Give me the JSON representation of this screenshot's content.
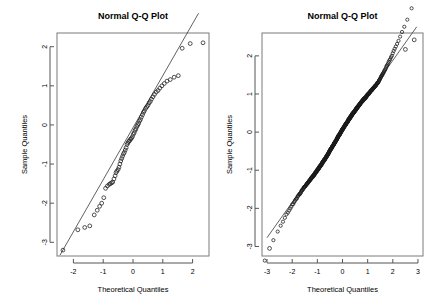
{
  "figure": {
    "background_color": "#ffffff",
    "foreground_color": "#000000",
    "panels": 2
  },
  "chart_data": [
    {
      "type": "scatter",
      "name": "left-qq-plot",
      "title": "Normal Q-Q Plot",
      "xlabel": "Theoretical Quantiles",
      "ylabel": "Sample Quantiles",
      "xlim": [
        -2.55,
        2.55
      ],
      "ylim": [
        -3.35,
        2.35
      ],
      "xticks": [
        -2,
        -1,
        0,
        1,
        2
      ],
      "xticklabels": [
        "-2",
        "-1",
        "0",
        "1",
        "2"
      ],
      "yticks": [
        -3,
        -2,
        -1,
        0,
        1,
        2
      ],
      "yticklabels": [
        "-3",
        "-2",
        "-1",
        "0",
        "1",
        "2"
      ],
      "grid": false,
      "legend": null,
      "marker": "open-circle",
      "reference_line": {
        "slope": 1.33,
        "intercept": -0.07,
        "x_from": -2.45,
        "x_to": 2.2
      },
      "x": [
        -2.35,
        -1.85,
        -1.62,
        -1.45,
        -1.3,
        -1.2,
        -1.12,
        -1.05,
        -0.98,
        -0.92,
        -0.86,
        -0.8,
        -0.76,
        -0.72,
        -0.68,
        -0.64,
        -0.6,
        -0.57,
        -0.54,
        -0.5,
        -0.47,
        -0.44,
        -0.41,
        -0.38,
        -0.35,
        -0.32,
        -0.29,
        -0.26,
        -0.23,
        -0.2,
        -0.17,
        -0.14,
        -0.11,
        -0.08,
        -0.05,
        -0.02,
        0.01,
        0.04,
        0.07,
        0.1,
        0.13,
        0.16,
        0.19,
        0.22,
        0.25,
        0.28,
        0.32,
        0.35,
        0.38,
        0.42,
        0.46,
        0.5,
        0.54,
        0.58,
        0.62,
        0.67,
        0.72,
        0.78,
        0.84,
        0.9,
        0.97,
        1.05,
        1.14,
        1.25,
        1.38,
        1.52,
        1.65,
        1.92,
        2.35
      ],
      "y": [
        -3.2,
        -2.68,
        -2.62,
        -2.58,
        -2.3,
        -2.18,
        -2.08,
        -2.0,
        -1.86,
        -1.62,
        -1.56,
        -1.52,
        -1.5,
        -1.48,
        -1.46,
        -1.38,
        -1.3,
        -1.22,
        -1.18,
        -1.14,
        -1.08,
        -1.0,
        -0.92,
        -0.86,
        -0.8,
        -0.74,
        -0.7,
        -0.64,
        -0.58,
        -0.5,
        -0.46,
        -0.42,
        -0.4,
        -0.36,
        -0.34,
        -0.3,
        -0.24,
        -0.2,
        -0.14,
        -0.1,
        -0.04,
        0.0,
        0.04,
        0.1,
        0.14,
        0.2,
        0.26,
        0.32,
        0.36,
        0.42,
        0.46,
        0.5,
        0.56,
        0.6,
        0.66,
        0.72,
        0.78,
        0.84,
        0.88,
        0.94,
        1.0,
        1.06,
        1.12,
        1.16,
        1.22,
        1.26,
        1.96,
        2.08,
        2.1
      ]
    },
    {
      "type": "scatter",
      "name": "right-qq-plot",
      "title": "Normal Q-Q Plot",
      "xlabel": "Theoretical Quantiles",
      "ylabel": "Sample Quantiles",
      "xlim": [
        -3.2,
        3.2
      ],
      "ylim": [
        -3.25,
        2.6
      ],
      "xticks": [
        -3,
        -2,
        -1,
        0,
        1,
        2,
        3
      ],
      "xticklabels": [
        "-3",
        "-2",
        "-1",
        "0",
        "1",
        "2",
        "3"
      ],
      "yticks": [
        -3,
        -2,
        -1,
        0,
        1,
        2
      ],
      "yticklabels": [
        "-3",
        "-2",
        "-1",
        "0",
        "1",
        "2"
      ],
      "grid": false,
      "legend": null,
      "marker": "open-circle",
      "n_points": 500,
      "reference_line": {
        "slope": 0.93,
        "intercept": 0.02,
        "x_from": -3.0,
        "x_to": 2.95
      },
      "note": "dense heavy-overplotted band through centre; mild S-shape with points above line at upper tail and below line at lower tail",
      "outliers": [
        {
          "x": -2.9,
          "y": -3.05
        },
        {
          "x": 2.5,
          "y": 2.17
        },
        {
          "x": 2.85,
          "y": 2.42
        }
      ]
    }
  ]
}
